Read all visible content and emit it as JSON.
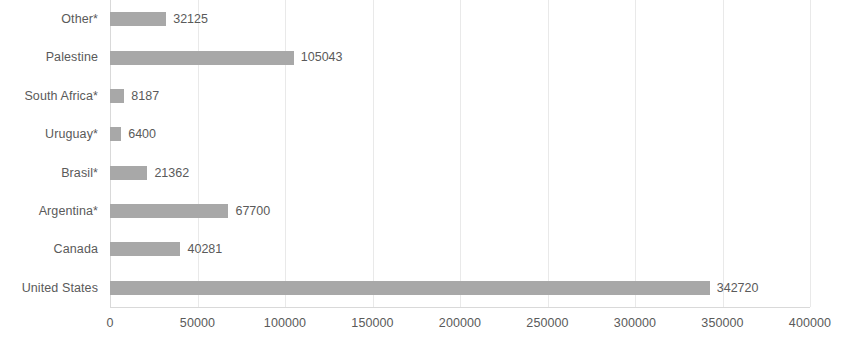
{
  "chart_data": {
    "type": "bar",
    "orientation": "horizontal",
    "title": "",
    "subtitle": "",
    "xlabel": "",
    "ylabel": "",
    "xlim": [
      0,
      400000
    ],
    "grid": true,
    "legend": false,
    "bar_color": "#a8a8a8",
    "text_color": "#5a5a5a",
    "gridline_color": "#e9e9e9",
    "background_color": "#ffffff",
    "xticks": [
      0,
      50000,
      100000,
      150000,
      200000,
      250000,
      300000,
      350000,
      400000
    ],
    "xtick_labels": [
      "0",
      "50000",
      "100000",
      "150000",
      "200000",
      "250000",
      "300000",
      "350000",
      "400000"
    ],
    "categories": [
      "Other*",
      "Palestine",
      "South Africa*",
      "Uruguay*",
      "Brasil*",
      "Argentina*",
      "Canada",
      "United States"
    ],
    "values": [
      32125,
      105043,
      8187,
      6400,
      21362,
      67700,
      40281,
      342720
    ],
    "data_labels": [
      "32125",
      "105043",
      "8187",
      "6400",
      "21362",
      "67700",
      "40281",
      "342720"
    ],
    "bars": [
      {
        "category": "Other*",
        "value": 32125,
        "label": "32125"
      },
      {
        "category": "Palestine",
        "value": 105043,
        "label": "105043"
      },
      {
        "category": "South Africa*",
        "value": 8187,
        "label": "8187"
      },
      {
        "category": "Uruguay*",
        "value": 6400,
        "label": "6400"
      },
      {
        "category": "Brasil*",
        "value": 21362,
        "label": "21362"
      },
      {
        "category": "Argentina*",
        "value": 67700,
        "label": "67700"
      },
      {
        "category": "Canada",
        "value": 40281,
        "label": "40281"
      },
      {
        "category": "United States",
        "value": 342720,
        "label": "342720"
      }
    ]
  }
}
